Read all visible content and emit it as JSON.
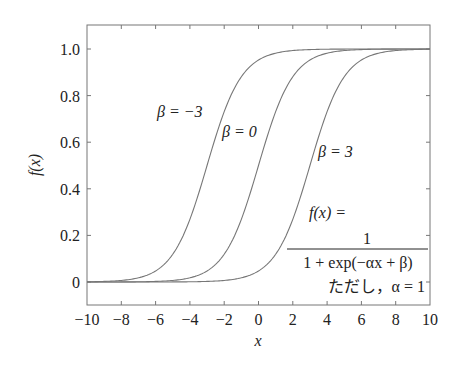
{
  "chart_data": {
    "type": "line",
    "title": "",
    "xlabel": "x",
    "ylabel": "f(x)",
    "xlim": [
      -10,
      10
    ],
    "ylim": [
      -0.1,
      1.1
    ],
    "x_ticks": [
      "-10",
      "-8",
      "-6",
      "-4",
      "-2",
      "0",
      "2",
      "4",
      "6",
      "8",
      "10"
    ],
    "y_ticks": [
      "0",
      "0.2",
      "0.4",
      "0.6",
      "0.8",
      "1.0"
    ],
    "grid": false,
    "formula": "f(x) = 1 / (1 + exp(-αx + β))",
    "alpha": 1,
    "x": [
      -10,
      -8,
      -6,
      -5,
      -4,
      -3,
      -2,
      -1,
      0,
      1,
      2,
      3,
      4,
      5,
      6,
      8,
      10
    ],
    "series": [
      {
        "name": "β=−3",
        "beta": -3,
        "values": [
          0.001,
          0.007,
          0.047,
          0.119,
          0.269,
          0.5,
          0.731,
          0.881,
          0.953,
          0.982,
          0.993,
          0.998,
          0.999,
          1.0,
          1.0,
          1.0,
          1.0
        ]
      },
      {
        "name": "β=0",
        "beta": 0,
        "values": [
          0.0,
          0.0,
          0.002,
          0.007,
          0.018,
          0.047,
          0.119,
          0.269,
          0.5,
          0.731,
          0.881,
          0.953,
          0.982,
          0.993,
          0.998,
          1.0,
          1.0
        ]
      },
      {
        "name": "β=3",
        "beta": 3,
        "values": [
          0.0,
          0.0,
          0.0,
          0.0,
          0.001,
          0.002,
          0.007,
          0.018,
          0.047,
          0.119,
          0.269,
          0.5,
          0.731,
          0.881,
          0.953,
          0.993,
          0.999
        ]
      }
    ],
    "annotations": {
      "label_beta_neg3": "β = −3",
      "label_beta_0": "β = 0",
      "label_beta_3": "β = 3",
      "formula_lhs": "f(x) =",
      "formula_num": "1",
      "formula_den": "1 + exp(−αx + β)",
      "note": "ただし，α = 1"
    }
  }
}
